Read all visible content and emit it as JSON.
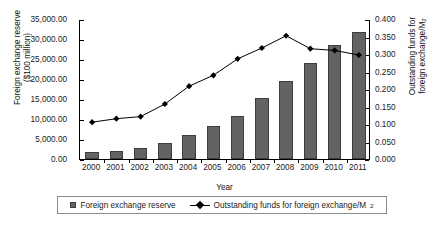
{
  "chart_data": {
    "type": "bar",
    "title": "",
    "xlabel": "Year",
    "ylabel": "Foreign exchange reserve ($100 million)",
    "ylabel_right": "Outstanding funds for foreign exchange/M",
    "ylabel_right_sub": "2",
    "ylabel_left_line1": "Foreign exchange reserve",
    "ylabel_left_line2": "($100 million)",
    "ylabel_right_line1": "Outstanding funds for",
    "ylabel_right_line2": "foreign exchange/M",
    "categories": [
      "2000",
      "2001",
      "2002",
      "2003",
      "2004",
      "2005",
      "2006",
      "2007",
      "2008",
      "2009",
      "2010",
      "2011"
    ],
    "ylim": [
      0,
      35000
    ],
    "ylim_right": [
      0,
      0.4
    ],
    "yticks": [
      "0.00",
      "5,000.00",
      "10,000.00",
      "15,000.00",
      "20,000.00",
      "25,000.00",
      "30,000.00",
      "35,000.00"
    ],
    "ytick_values": [
      0,
      5000,
      10000,
      15000,
      20000,
      25000,
      30000,
      35000
    ],
    "yticks_right": [
      "0.000",
      "0.050",
      "0.100",
      "0.150",
      "0.200",
      "0.250",
      "0.300",
      "0.350",
      "0.400"
    ],
    "ytick_values_right": [
      0,
      0.05,
      0.1,
      0.15,
      0.2,
      0.25,
      0.3,
      0.35,
      0.4
    ],
    "grid": false,
    "legend_position": "bottom",
    "series": [
      {
        "name": "Foreign exchange reserve",
        "type": "bar",
        "axis": "left",
        "color": "#636363",
        "values": [
          1656,
          2122,
          2864,
          4033,
          6099,
          8189,
          10663,
          15282,
          19460,
          23992,
          28473,
          31811
        ]
      },
      {
        "name": "Outstanding funds for foreign exchange/M2",
        "type": "line",
        "axis": "right",
        "color": "#000000",
        "marker": "diamond",
        "values": [
          0.108,
          0.118,
          0.124,
          0.16,
          0.211,
          0.242,
          0.289,
          0.32,
          0.355,
          0.318,
          0.313,
          0.3
        ]
      }
    ]
  },
  "legend": {
    "entries": [
      {
        "label": "Foreign exchange reserve",
        "marker": "square-swatch"
      },
      {
        "label": "Outstanding funds for foreign exchange/M",
        "sub": "2",
        "marker": "line-diamond"
      }
    ]
  }
}
